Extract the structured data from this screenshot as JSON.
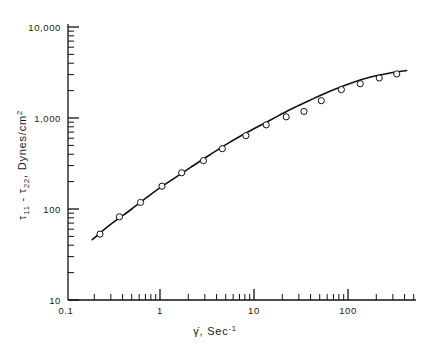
{
  "figure": {
    "name": "normal-stress-difference-vs-shear-rate",
    "background_color": "#ffffff",
    "ink_color": "#111111"
  },
  "chart_data": {
    "type": "scatter",
    "title": "",
    "subtitle": "",
    "xlabel_parts": {
      "symbol": "γ̇",
      "comma": ", ",
      "unit_base": "Sec",
      "unit_exponent": "-1"
    },
    "xlabel": "γ̇, Sec⁻¹",
    "ylabel_parts": {
      "tau": "τ",
      "sub1": "11",
      "minus": " - ",
      "tau2": "τ",
      "sub2": "22",
      "rest": ", Dynes/cm",
      "exponent": "2"
    },
    "ylabel": "τ₁₁ - τ₂₂, Dynes/cm²",
    "xscale": "log",
    "yscale": "log",
    "xlim": [
      0.1,
      500
    ],
    "ylim": [
      10,
      10000
    ],
    "grid": false,
    "legend": null,
    "x_tick_labels": [
      "0.1",
      "1",
      "10",
      "100"
    ],
    "x_tick_values": [
      0.1,
      1,
      10,
      100
    ],
    "y_tick_labels": [
      "10",
      "100",
      "1,000",
      "10,000"
    ],
    "y_tick_values": [
      10,
      100,
      1000,
      10000
    ],
    "marker_style": "open-circle",
    "series": [
      {
        "name": "measured normal stress difference",
        "marker": "open-circle",
        "x": [
          0.23,
          0.37,
          0.62,
          1.05,
          1.7,
          2.9,
          4.6,
          8.2,
          13.5,
          22.0,
          34.0,
          52.0,
          85.0,
          135.0,
          215.0,
          330.0
        ],
        "y": [
          53,
          82,
          118,
          178,
          250,
          340,
          460,
          640,
          840,
          1030,
          1180,
          1550,
          2050,
          2380,
          2750,
          3050
        ]
      }
    ],
    "fit_curve": {
      "name": "smooth fitted curve",
      "x": [
        0.19,
        0.3,
        0.5,
        0.8,
        1.3,
        2.1,
        3.4,
        5.5,
        9.0,
        15.0,
        24.0,
        40.0,
        65.0,
        105.0,
        170.0,
        280.0,
        420.0
      ],
      "y": [
        46,
        68,
        100,
        145,
        205,
        285,
        395,
        540,
        720,
        950,
        1230,
        1580,
        1980,
        2400,
        2800,
        3120,
        3320
      ]
    },
    "annotations": []
  },
  "geometry": {
    "plot_left_px": 68,
    "plot_right_px": 416,
    "plot_bottom_px": 300,
    "plot_top_px": 24,
    "x_decade_px": 94,
    "y_decade_px": 91,
    "x_ref_value": 1,
    "x_ref_px": 160,
    "y_ref_value": 10,
    "y_ref_px": 300
  }
}
